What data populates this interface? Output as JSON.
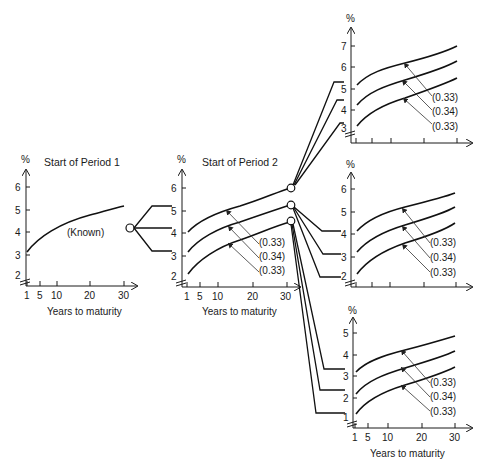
{
  "diagram": {
    "type": "interest-rate-tree",
    "units_label": "%",
    "x_axis_label": "Years to maturity",
    "x_ticks": [
      "1",
      "5",
      "10",
      "20",
      "30"
    ],
    "panels": [
      {
        "id": "period1",
        "title": "Start of Period 1",
        "y_ticks": [
          "2",
          "3",
          "4",
          "5",
          "6"
        ],
        "curve_labels": [
          "(Known)"
        ],
        "show_x_labels": true
      },
      {
        "id": "period2",
        "title": "Start of Period 2",
        "y_ticks": [
          "2",
          "3",
          "4",
          "5",
          "6"
        ],
        "probabilities": [
          "(0.33)",
          "(0.34)",
          "(0.33)"
        ],
        "show_x_labels": true
      },
      {
        "id": "period3-high",
        "title": "",
        "y_ticks": [
          "3",
          "4",
          "5",
          "6",
          "7"
        ],
        "probabilities": [
          "(0.33)",
          "(0.34)",
          "(0.33)"
        ],
        "show_x_labels": false
      },
      {
        "id": "period3-mid",
        "title": "",
        "y_ticks": [
          "2",
          "3",
          "4",
          "5",
          "6"
        ],
        "probabilities": [
          "(0.33)",
          "(0.34)",
          "(0.33)"
        ],
        "show_x_labels": false
      },
      {
        "id": "period3-low",
        "title": "",
        "y_ticks": [
          "1",
          "2",
          "3",
          "4",
          "5"
        ],
        "probabilities": [
          "(0.33)",
          "(0.34)",
          "(0.33)"
        ],
        "show_x_labels": true
      }
    ]
  }
}
